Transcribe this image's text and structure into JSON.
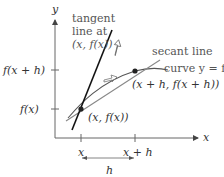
{
  "axes": {
    "x_label": "x",
    "y_label": "y"
  },
  "ticks": {
    "x_ticks": [
      "x",
      "x + h"
    ],
    "y_ticks": [
      "f(x + h)",
      "f(x)"
    ]
  },
  "interval": {
    "label": "h"
  },
  "annotations": {
    "tangent_label_line1": "tangent",
    "tangent_label_line2": "line at",
    "tangent_label_line3": "(x, f(x))",
    "secant_label": "secant line",
    "curve_label": "curve y = f",
    "point_a_label": "(x, f(x))",
    "point_b_label": "(x + h, f(x + h))"
  },
  "colors": {
    "axis": "#666666",
    "tangent": "#111111",
    "secant": "#777777",
    "curve": "#555555",
    "text": "#333333"
  }
}
